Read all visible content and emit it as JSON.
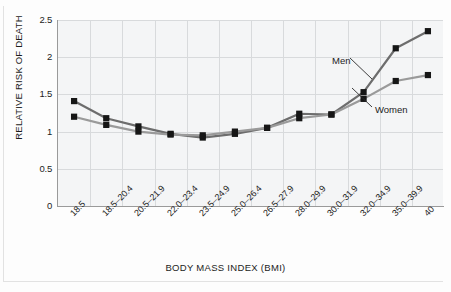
{
  "chart_data": {
    "type": "line",
    "title": "",
    "xlabel": "BODY MASS INDEX (BMI)",
    "ylabel": "RELATIVE RISK OF DEATH",
    "ylim": [
      0,
      2.5
    ],
    "ytick_labels": [
      "2.5",
      "2",
      "1.5",
      "1",
      "0.5",
      "0"
    ],
    "yticks": [
      2.5,
      2,
      1.5,
      1,
      0.5,
      0
    ],
    "grid": true,
    "legend_position": "inline-annotation",
    "categories": [
      "18.5",
      "18.5–20.4",
      "20.5–21.9",
      "22.0–23.4",
      "23.5–24.9",
      "25.0–26.4",
      "26.5–27.9",
      "28.0–29.9",
      "30.0–31.9",
      "32.0–34.9",
      "35.0–39.9",
      "40"
    ],
    "series": [
      {
        "name": "Men",
        "color": "#6d6d6d",
        "values": [
          1.41,
          1.18,
          1.07,
          0.97,
          0.92,
          0.97,
          1.05,
          1.24,
          1.23,
          1.53,
          2.12,
          2.35
        ]
      },
      {
        "name": "Women",
        "color": "#9a9a9a",
        "values": [
          1.2,
          1.09,
          1.0,
          0.96,
          0.95,
          1.0,
          1.05,
          1.18,
          1.23,
          1.44,
          1.68,
          1.76
        ]
      }
    ],
    "annotations": [
      {
        "text": "Men",
        "series": "Men"
      },
      {
        "text": "Women",
        "series": "Women"
      }
    ]
  },
  "colors": {
    "plot_background": "#f4f5f6",
    "gridline": "#d8dadc",
    "axis": "#9a9a9a",
    "marker": "#161616",
    "men_line": "#6d6d6d",
    "women_line": "#9a9a9a",
    "text": "#1c1c1c"
  }
}
